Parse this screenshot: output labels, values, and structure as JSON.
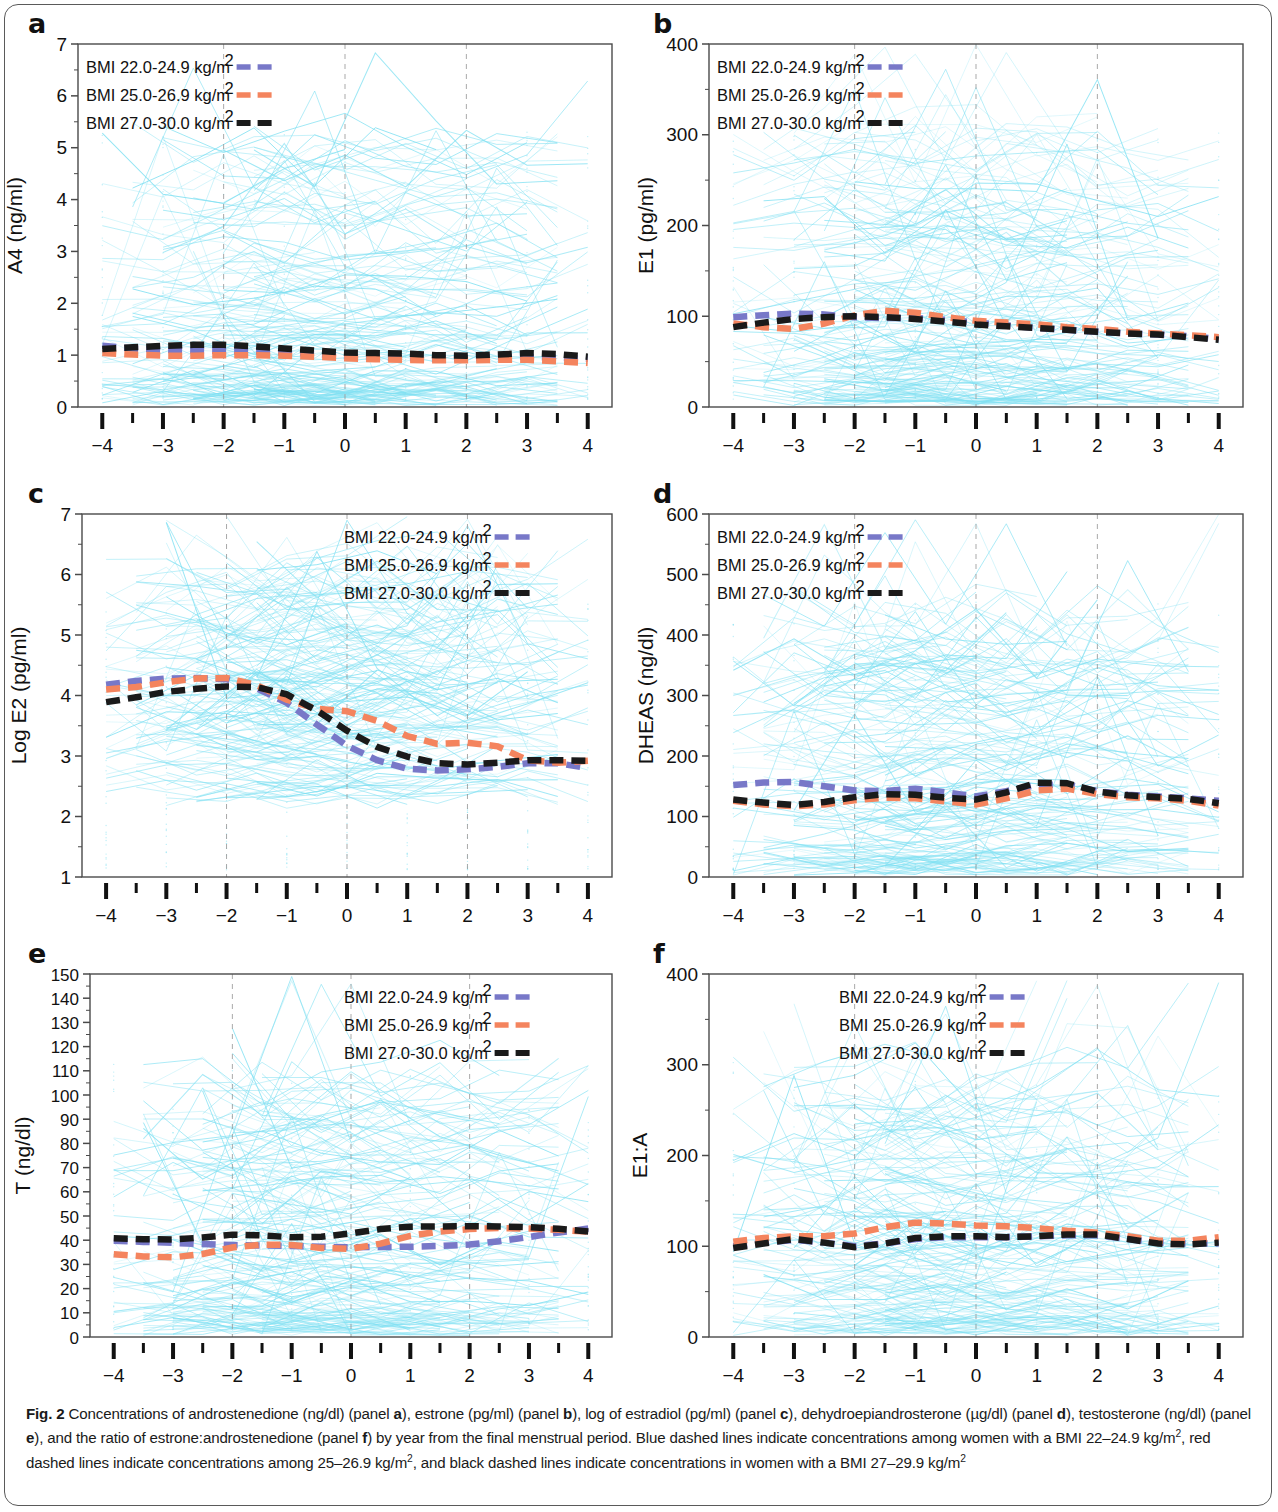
{
  "figure": {
    "label": "Fig. 2",
    "caption_runs": [
      {
        "t": "Fig. 2",
        "b": true
      },
      {
        "t": " Concentrations of androstenedione (ng/dl) (panel "
      },
      {
        "t": "a",
        "b": true
      },
      {
        "t": "), estrone (pg/ml) (panel "
      },
      {
        "t": "b",
        "b": true
      },
      {
        "t": "), log of estradiol (pg/ml) (panel "
      },
      {
        "t": "c",
        "b": true
      },
      {
        "t": "), dehydroepiandrosterone (µg/dl) (panel "
      },
      {
        "t": "d",
        "b": true
      },
      {
        "t": "), testosterone (ng/dl) (panel "
      },
      {
        "t": "e",
        "b": true
      },
      {
        "t": "), and the ratio of estrone:androstenedione (panel "
      },
      {
        "t": "f",
        "b": true
      },
      {
        "t": ") by year from the final menstrual period. Blue dashed lines indicate concentrations among women with a BMI 22–24.9 kg/m"
      },
      {
        "t": "2",
        "sup": true
      },
      {
        "t": ", red dashed lines indicate concentrations among 25–26.9 kg/m"
      },
      {
        "t": "2",
        "sup": true
      },
      {
        "t": ", and black dashed lines indicate concentrations in women with a BMI 27–29.9 kg/m"
      },
      {
        "t": "2",
        "sup": true
      }
    ]
  },
  "colors": {
    "blue": "#7878C8",
    "red": "#F4845E",
    "black": "#1a1a1a",
    "spaghetti": "#7FE0F2",
    "grid": "#9a9a9a",
    "axis": "#4a4a4a"
  },
  "legend": {
    "entries": [
      {
        "label": "BMI 22.0-24.9 kg/m",
        "sup": "2",
        "color_key": "blue"
      },
      {
        "label": "BMI 25.0-26.9 kg/m",
        "sup": "2",
        "color_key": "red"
      },
      {
        "label": "BMI 27.0-30.0 kg/m",
        "sup": "2",
        "color_key": "black"
      }
    ]
  },
  "chart_data": [
    {
      "panel": "a",
      "type": "line",
      "title": "",
      "xlabel": "Number of years from FMP",
      "ylabel": "A4 (ng/ml)",
      "x": [
        -4,
        -3.5,
        -3,
        -2.5,
        -2,
        -1.5,
        -1,
        -0.5,
        0,
        0.5,
        1,
        1.5,
        2,
        2.5,
        3,
        3.5,
        4
      ],
      "xlim": [
        -4.4,
        4.4
      ],
      "ylim": [
        0,
        7
      ],
      "xticks": [
        -4,
        -3,
        -2,
        -1,
        0,
        1,
        2,
        3,
        4
      ],
      "yticks": [
        0,
        1,
        2,
        3,
        4,
        5,
        6,
        7
      ],
      "grid": "vertical-dashed at -2, 0, 2",
      "legend_position": "top-left",
      "series": [
        {
          "name": "BMI 22.0-24.9 kg/m2",
          "color_key": "blue",
          "values": [
            1.18,
            1.13,
            1.1,
            1.09,
            1.08,
            1.07,
            1.05,
            1.02,
            0.98,
            0.96,
            0.94,
            0.93,
            0.94,
            0.96,
            0.97,
            0.95,
            0.93
          ]
        },
        {
          "name": "BMI 25.0-26.9 kg/m2",
          "color_key": "red",
          "values": [
            1.04,
            1.01,
            0.99,
            0.99,
            1.0,
            1.0,
            0.99,
            0.97,
            0.94,
            0.92,
            0.91,
            0.9,
            0.9,
            0.91,
            0.91,
            0.88,
            0.85
          ]
        },
        {
          "name": "BMI 27.0-30.0 kg/m2",
          "color_key": "black",
          "values": [
            1.12,
            1.15,
            1.18,
            1.2,
            1.2,
            1.17,
            1.13,
            1.09,
            1.05,
            1.04,
            1.03,
            1.0,
            0.99,
            1.01,
            1.04,
            1.02,
            0.97
          ]
        }
      ]
    },
    {
      "panel": "b",
      "type": "line",
      "title": "",
      "xlabel": "Number of years from FMP",
      "ylabel": "E1 (pg/ml)",
      "x": [
        -4,
        -3.5,
        -3,
        -2.5,
        -2,
        -1.5,
        -1,
        -0.5,
        0,
        0.5,
        1,
        1.5,
        2,
        2.5,
        3,
        3.5,
        4
      ],
      "xlim": [
        -4.4,
        4.4
      ],
      "ylim": [
        0,
        400
      ],
      "xticks": [
        -4,
        -3,
        -2,
        -1,
        0,
        1,
        2,
        3,
        4
      ],
      "yticks": [
        0,
        100,
        200,
        300,
        400
      ],
      "grid": "vertical-dashed at -2, 0, 2",
      "legend_position": "top-left",
      "series": [
        {
          "name": "BMI 22.0-24.9 kg/m2",
          "color_key": "blue",
          "values": [
            99,
            101,
            103,
            102,
            99,
            98,
            98,
            96,
            93,
            90,
            87,
            85,
            83,
            81,
            80,
            78,
            75
          ]
        },
        {
          "name": "BMI 25.0-26.9 kg/m2",
          "color_key": "red",
          "values": [
            92,
            88,
            86,
            92,
            101,
            106,
            104,
            99,
            95,
            93,
            91,
            88,
            86,
            83,
            81,
            79,
            77
          ]
        },
        {
          "name": "BMI 27.0-30.0 kg/m2",
          "color_key": "black",
          "values": [
            88,
            93,
            97,
            99,
            100,
            99,
            97,
            94,
            91,
            89,
            87,
            85,
            83,
            81,
            80,
            77,
            74
          ]
        }
      ]
    },
    {
      "panel": "c",
      "type": "line",
      "title": "",
      "xlabel": "Number of years from FMP",
      "ylabel": "Log E2 (pg/ml)",
      "x": [
        -4,
        -3.5,
        -3,
        -2.5,
        -2,
        -1.5,
        -1,
        -0.5,
        0,
        0.5,
        1,
        1.5,
        2,
        2.5,
        3,
        3.5,
        4
      ],
      "xlim": [
        -4.4,
        4.4
      ],
      "ylim": [
        1,
        7
      ],
      "xticks": [
        -4,
        -3,
        -2,
        -1,
        0,
        1,
        2,
        3,
        4
      ],
      "yticks": [
        1,
        2,
        3,
        4,
        5,
        6,
        7
      ],
      "grid": "vertical-dashed at -2, 0, 2",
      "legend_position": "top-right",
      "series": [
        {
          "name": "BMI 22.0-24.9 kg/m2",
          "color_key": "blue",
          "values": [
            4.18,
            4.24,
            4.28,
            4.29,
            4.27,
            4.12,
            3.88,
            3.52,
            3.17,
            2.93,
            2.79,
            2.76,
            2.78,
            2.82,
            2.88,
            2.88,
            2.8
          ]
        },
        {
          "name": "BMI 25.0-26.9 kg/m2",
          "color_key": "red",
          "values": [
            4.1,
            4.14,
            4.22,
            4.28,
            4.29,
            4.17,
            3.93,
            3.78,
            3.74,
            3.58,
            3.33,
            3.2,
            3.22,
            3.16,
            2.93,
            2.89,
            2.92
          ]
        },
        {
          "name": "BMI 27.0-30.0 kg/m2",
          "color_key": "black",
          "values": [
            3.89,
            3.97,
            4.06,
            4.11,
            4.15,
            4.14,
            4.02,
            3.75,
            3.42,
            3.15,
            2.99,
            2.88,
            2.86,
            2.89,
            2.93,
            2.93,
            2.92
          ]
        }
      ]
    },
    {
      "panel": "d",
      "type": "line",
      "title": "",
      "xlabel": "Number of years from FMP",
      "ylabel": "DHEAS (ng/dl)",
      "x": [
        -4,
        -3.5,
        -3,
        -2.5,
        -2,
        -1.5,
        -1,
        -0.5,
        0,
        0.5,
        1,
        1.5,
        2,
        2.5,
        3,
        3.5,
        4
      ],
      "xlim": [
        -4.4,
        4.4
      ],
      "ylim": [
        0,
        600
      ],
      "xticks": [
        -4,
        -3,
        -2,
        -1,
        0,
        1,
        2,
        3,
        4
      ],
      "yticks": [
        0,
        100,
        200,
        300,
        400,
        500,
        600
      ],
      "grid": "vertical-dashed at -2, 0, 2",
      "legend_position": "top-left",
      "series": [
        {
          "name": "BMI 22.0-24.9 kg/m2",
          "color_key": "blue",
          "values": [
            152,
            156,
            157,
            150,
            143,
            142,
            146,
            140,
            133,
            142,
            152,
            153,
            142,
            136,
            133,
            130,
            126
          ]
        },
        {
          "name": "BMI 25.0-26.9 kg/m2",
          "color_key": "red",
          "values": [
            126,
            120,
            117,
            120,
            127,
            131,
            130,
            125,
            120,
            130,
            143,
            146,
            137,
            132,
            130,
            126,
            118
          ]
        },
        {
          "name": "BMI 27.0-30.0 kg/m2",
          "color_key": "black",
          "values": [
            128,
            123,
            119,
            124,
            132,
            137,
            136,
            131,
            128,
            140,
            156,
            155,
            141,
            135,
            132,
            129,
            122
          ]
        }
      ]
    },
    {
      "panel": "e",
      "type": "line",
      "title": "",
      "xlabel": "Number of years from FMP",
      "ylabel": "T (ng/dl)",
      "x": [
        -4,
        -3.5,
        -3,
        -2.5,
        -2,
        -1.5,
        -1,
        -0.5,
        0,
        0.5,
        1,
        1.5,
        2,
        2.5,
        3,
        3.5,
        4
      ],
      "xlim": [
        -4.4,
        4.4
      ],
      "ylim": [
        0,
        150
      ],
      "xticks": [
        -4,
        -3,
        -2,
        -1,
        0,
        1,
        2,
        3,
        4
      ],
      "yticks": [
        0,
        10,
        20,
        30,
        40,
        50,
        60,
        70,
        80,
        90,
        100,
        110,
        120,
        130,
        140,
        150
      ],
      "grid": "vertical-dashed at -2, 0, 2",
      "legend_position": "top-right",
      "series": [
        {
          "name": "BMI 22.0-24.9 kg/m2",
          "color_key": "blue",
          "values": [
            39.8,
            39.3,
            38.9,
            38.4,
            38.0,
            37.8,
            37.6,
            37.3,
            37.1,
            37.2,
            37.3,
            37.6,
            38.2,
            39.6,
            41.3,
            43.2,
            44.8
          ]
        },
        {
          "name": "BMI 25.0-26.9 kg/m2",
          "color_key": "red",
          "values": [
            34.2,
            33.3,
            32.9,
            34.3,
            37.0,
            38.2,
            38.0,
            36.8,
            36.4,
            38.6,
            41.8,
            43.6,
            44.6,
            45.0,
            44.8,
            44.3,
            43.5
          ]
        },
        {
          "name": "BMI 27.0-30.0 kg/m2",
          "color_key": "black",
          "values": [
            40.8,
            40.4,
            40.3,
            41.1,
            42.3,
            42.0,
            41.2,
            41.4,
            42.8,
            44.6,
            45.6,
            45.7,
            45.8,
            45.7,
            45.4,
            44.7,
            43.6
          ]
        }
      ]
    },
    {
      "panel": "f",
      "type": "line",
      "title": "",
      "xlabel": "Number of years from FMP",
      "ylabel": "E1:A",
      "x": [
        -4,
        -3.5,
        -3,
        -2.5,
        -2,
        -1.5,
        -1,
        -0.5,
        0,
        0.5,
        1,
        1.5,
        2,
        2.5,
        3,
        3.5,
        4
      ],
      "xlim": [
        -4.4,
        4.4
      ],
      "ylim": [
        0,
        400
      ],
      "xticks": [
        -4,
        -3,
        -2,
        -1,
        0,
        1,
        2,
        3,
        4
      ],
      "yticks": [
        0,
        100,
        200,
        300,
        400
      ],
      "grid": "vertical-dashed at -2, 0, 2",
      "legend_position": "top-center",
      "series": [
        {
          "name": "BMI 22.0-24.9 kg/m2",
          "color_key": "blue",
          "values": [
            100,
            104,
            107,
            104,
            100,
            103,
            108,
            110,
            110,
            110,
            111,
            112,
            112,
            108,
            104,
            103,
            103
          ]
        },
        {
          "name": "BMI 25.0-26.9 kg/m2",
          "color_key": "red",
          "values": [
            105,
            109,
            111,
            111,
            114,
            121,
            126,
            125,
            123,
            122,
            120,
            117,
            115,
            111,
            106,
            106,
            110
          ]
        },
        {
          "name": "BMI 27.0-30.0 kg/m2",
          "color_key": "black",
          "values": [
            98,
            103,
            108,
            104,
            99,
            103,
            109,
            111,
            111,
            110,
            111,
            113,
            113,
            108,
            103,
            102,
            104
          ]
        }
      ]
    }
  ]
}
